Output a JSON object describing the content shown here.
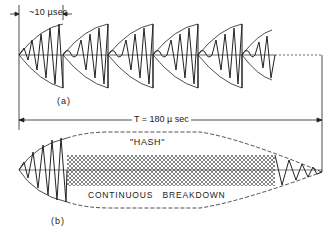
{
  "figure": {
    "labels": {
      "burst_duration": "~10 µsec",
      "panel_a": "(a)",
      "total_period": "T = 180 µ sec",
      "hash": "\"HASH\"",
      "continuous_breakdown": "CONTINUOUS   BREAKDOWN",
      "panel_b": "(b)"
    },
    "panel_a": {
      "description": "Train of discrete RF bursts, each ~10 µsec, with rising envelope",
      "burst_count": 6,
      "burst_starts_px": [
        19,
        63,
        108,
        153,
        198,
        242
      ],
      "axis_y_px": 55
    },
    "panel_b": {
      "description": "Single pulse of T = 180 µsec with initial oscillation, continuous breakdown hash region, and decaying tail",
      "axis_y_px": 170,
      "hash_region_px": [
        67,
        275
      ]
    },
    "colors": {
      "line": "#222222",
      "background": "#ffffff"
    }
  }
}
